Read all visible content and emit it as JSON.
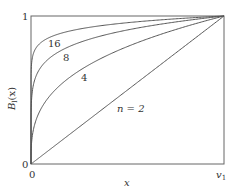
{
  "chart_data": {
    "type": "line",
    "title": "",
    "xlabel": "x",
    "ylabel": "B_l(x)",
    "ylabel_display": {
      "main": "B",
      "sub": "l",
      "arg": "(x)"
    },
    "xlim": [
      0,
      1
    ],
    "ylim": [
      0,
      1
    ],
    "x_ticks": [
      {
        "value": 0,
        "label": "0"
      },
      {
        "value": 1,
        "label": "v1",
        "display_main": "v",
        "display_sub": "1"
      }
    ],
    "y_ticks": [
      {
        "value": 0,
        "label": "0"
      },
      {
        "value": 1,
        "label": "1"
      }
    ],
    "grid": false,
    "legend": "none (inline curve labels)",
    "series": [
      {
        "name": "n = 2",
        "label": "n = 2",
        "exponent": 1.0,
        "x": [
          0,
          0.25,
          0.5,
          0.75,
          1.0
        ],
        "y": [
          0,
          0.25,
          0.5,
          0.75,
          1.0
        ]
      },
      {
        "name": "4",
        "label": "4",
        "exponent": 0.3333,
        "x": [
          0,
          0.05,
          0.125,
          0.25,
          0.5,
          0.75,
          1.0
        ],
        "y": [
          0,
          0.37,
          0.5,
          0.63,
          0.79,
          0.91,
          1.0
        ]
      },
      {
        "name": "8",
        "label": "8",
        "exponent": 0.1429,
        "x": [
          0,
          0.05,
          0.125,
          0.25,
          0.5,
          0.75,
          1.0
        ],
        "y": [
          0,
          0.65,
          0.74,
          0.82,
          0.91,
          0.96,
          1.0
        ]
      },
      {
        "name": "16",
        "label": "16",
        "exponent": 0.0667,
        "x": [
          0,
          0.05,
          0.125,
          0.25,
          0.5,
          0.75,
          1.0
        ],
        "y": [
          0,
          0.82,
          0.87,
          0.91,
          0.95,
          0.98,
          1.0
        ]
      }
    ],
    "annotations": [
      {
        "text": "16",
        "x": 0.11,
        "y": 0.82
      },
      {
        "text": "8",
        "x": 0.18,
        "y": 0.71
      },
      {
        "text": "4",
        "x": 0.27,
        "y": 0.58
      },
      {
        "text": "n = 2",
        "x": 0.46,
        "y": 0.38
      }
    ]
  },
  "labels": {
    "y_top": "1",
    "y_bottom": "0",
    "x_left": "0",
    "x_right_main": "v",
    "x_right_sub": "1",
    "x_axis": "x",
    "y_axis_main": "B",
    "y_axis_sub": "l",
    "y_axis_arg": "(x)",
    "curve_16": "16",
    "curve_8": "8",
    "curve_4": "4",
    "curve_2": "n = 2"
  },
  "colors": {
    "line": "#555555",
    "frame": "#666666",
    "text": "#333333"
  }
}
